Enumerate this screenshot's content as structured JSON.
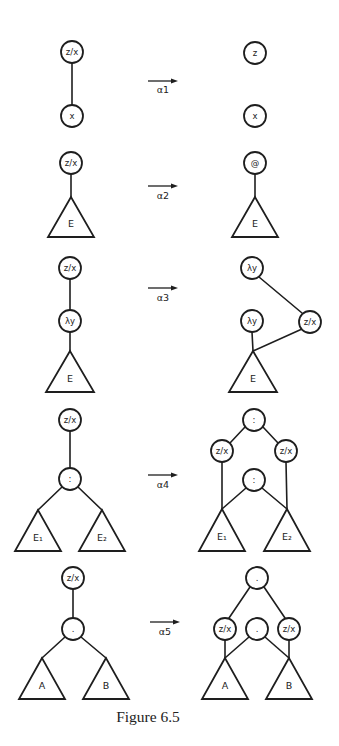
{
  "figure": {
    "caption": "Figure 6.5",
    "colors": {
      "ink": "#1e1e1e",
      "paper": "#ffffff"
    },
    "node_radius": 11,
    "rows": [
      {
        "id": "alpha1",
        "rule_label": "α1",
        "arrow": {
          "x1": 148,
          "x2": 178,
          "y": 81,
          "label_y": 93
        },
        "left": {
          "nodes": [
            {
              "id": "zx",
              "label": "z/x",
              "x": 72,
              "y": 52
            },
            {
              "id": "x",
              "label": "x",
              "x": 72,
              "y": 116
            }
          ],
          "triangles": [],
          "edges": [
            [
              72,
              63,
              72,
              105
            ]
          ]
        },
        "right": {
          "nodes": [
            {
              "id": "z",
              "label": "z",
              "x": 255,
              "y": 53
            },
            {
              "id": "x",
              "label": "x",
              "x": 255,
              "y": 116
            }
          ],
          "triangles": [],
          "edges": []
        }
      },
      {
        "id": "alpha2",
        "rule_label": "α2",
        "arrow": {
          "x1": 148,
          "x2": 178,
          "y": 186,
          "label_y": 199
        },
        "left": {
          "nodes": [
            {
              "id": "zx",
              "label": "z/x",
              "x": 71,
              "y": 163
            }
          ],
          "triangles": [
            {
              "label": "E",
              "apex": [
                71,
                197
              ],
              "base_y": 237,
              "half_width": 23
            }
          ],
          "edges": [
            [
              71,
              174,
              71,
              197
            ]
          ]
        },
        "right": {
          "nodes": [
            {
              "id": "at",
              "label": "@",
              "x": 255,
              "y": 163
            }
          ],
          "triangles": [
            {
              "label": "E",
              "apex": [
                255,
                197
              ],
              "base_y": 237,
              "half_width": 23
            }
          ],
          "edges": [
            [
              255,
              174,
              255,
              197
            ]
          ]
        }
      },
      {
        "id": "alpha3",
        "rule_label": "α3",
        "arrow": {
          "x1": 148,
          "x2": 178,
          "y": 288,
          "label_y": 301
        },
        "left": {
          "nodes": [
            {
              "id": "zx",
              "label": "z/x",
              "x": 70,
              "y": 268
            },
            {
              "id": "lambda-y",
              "label": "λy",
              "x": 70,
              "y": 321
            }
          ],
          "triangles": [
            {
              "label": "E",
              "apex": [
                70,
                351
              ],
              "base_y": 392,
              "half_width": 24
            }
          ],
          "edges": [
            [
              70,
              279,
              70,
              310
            ],
            [
              70,
              332,
              70,
              351
            ]
          ]
        },
        "right": {
          "nodes": [
            {
              "id": "lambda-y-top",
              "label": "λy",
              "x": 252,
              "y": 268
            },
            {
              "id": "lambda-y",
              "label": "λy",
              "x": 252,
              "y": 321
            },
            {
              "id": "zx",
              "label": "z/x",
              "x": 310,
              "y": 322
            }
          ],
          "triangles": [
            {
              "label": "E",
              "apex": [
                253,
                351
              ],
              "base_y": 392,
              "half_width": 24
            }
          ],
          "edges": [
            [
              259,
              277,
              302,
              313
            ],
            [
              252,
              332,
              253,
              351
            ],
            [
              253,
              351,
              302,
              329
            ]
          ]
        }
      },
      {
        "id": "alpha4",
        "rule_label": "α4",
        "arrow": {
          "x1": 148,
          "x2": 178,
          "y": 475,
          "label_y": 488
        },
        "left": {
          "nodes": [
            {
              "id": "zx",
              "label": "z/x",
              "x": 70,
              "y": 420
            },
            {
              "id": "colon",
              "label": ":",
              "x": 70,
              "y": 479
            }
          ],
          "triangles": [
            {
              "label": "E₁",
              "apex": [
                38,
                510
              ],
              "base_y": 551,
              "half_width": 23
            },
            {
              "label": "E₂",
              "apex": [
                102,
                510
              ],
              "base_y": 551,
              "half_width": 23
            }
          ],
          "edges": [
            [
              70,
              431,
              70,
              468
            ],
            [
              62,
              487,
              38,
              510
            ],
            [
              78,
              487,
              102,
              510
            ]
          ]
        },
        "right": {
          "nodes": [
            {
              "id": "colon-top",
              "label": ":",
              "x": 254,
              "y": 420
            },
            {
              "id": "zx-left",
              "label": "z/x",
              "x": 222,
              "y": 451
            },
            {
              "id": "zx-right",
              "label": "z/x",
              "x": 286,
              "y": 451
            },
            {
              "id": "colon-mid",
              "label": ":",
              "x": 254,
              "y": 480
            }
          ],
          "triangles": [
            {
              "label": "E₁",
              "apex": [
                222,
                509
              ],
              "base_y": 551,
              "half_width": 23
            },
            {
              "label": "E₂",
              "apex": [
                287,
                509
              ],
              "base_y": 551,
              "half_width": 23
            }
          ],
          "edges": [
            [
              245,
              427,
              230,
              443
            ],
            [
              263,
              427,
              278,
              443
            ],
            [
              222,
              462,
              222,
              509
            ],
            [
              286,
              462,
              287,
              509
            ],
            [
              246,
              488,
              222,
              509
            ],
            [
              262,
              488,
              287,
              509
            ]
          ]
        }
      },
      {
        "id": "alpha5",
        "rule_label": "α5",
        "arrow": {
          "x1": 150,
          "x2": 180,
          "y": 622,
          "label_y": 635
        },
        "left": {
          "nodes": [
            {
              "id": "zx",
              "label": "z/x",
              "x": 73,
              "y": 578
            },
            {
              "id": "dot",
              "label": ".",
              "x": 73,
              "y": 629
            }
          ],
          "triangles": [
            {
              "label": "A",
              "apex": [
                42,
                658
              ],
              "base_y": 699,
              "half_width": 23
            },
            {
              "label": "B",
              "apex": [
                106,
                658
              ],
              "base_y": 699,
              "half_width": 23
            }
          ],
          "edges": [
            [
              73,
              589,
              73,
              618
            ],
            [
              65,
              637,
              42,
              658
            ],
            [
              81,
              637,
              106,
              658
            ]
          ]
        },
        "right": {
          "nodes": [
            {
              "id": "dot-top",
              "label": ".",
              "x": 257,
              "y": 578
            },
            {
              "id": "zx-left",
              "label": "z/x",
              "x": 225,
              "y": 629
            },
            {
              "id": "dot-mid",
              "label": ".",
              "x": 257,
              "y": 629
            },
            {
              "id": "zx-right",
              "label": "z/x",
              "x": 289,
              "y": 629
            }
          ],
          "triangles": [
            {
              "label": "A",
              "apex": [
                225,
                658
              ],
              "base_y": 699,
              "half_width": 23
            },
            {
              "label": "B",
              "apex": [
                289,
                658
              ],
              "base_y": 699,
              "half_width": 23
            }
          ],
          "edges": [
            [
              250,
              587,
              229,
              618
            ],
            [
              264,
              587,
              285,
              618
            ],
            [
              225,
              640,
              225,
              658
            ],
            [
              289,
              640,
              289,
              658
            ],
            [
              249,
              637,
              225,
              658
            ],
            [
              265,
              637,
              289,
              658
            ]
          ]
        }
      }
    ],
    "caption_pos": {
      "x": 148,
      "y": 722
    }
  }
}
